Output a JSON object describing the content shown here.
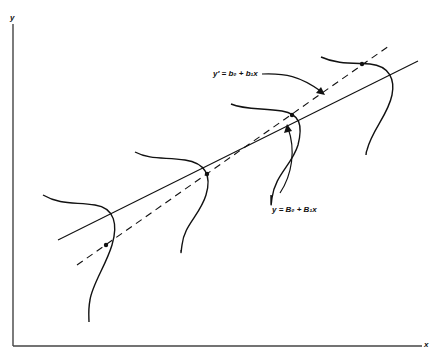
{
  "diagram": {
    "axes": {
      "x_label": "x",
      "y_label": "y"
    },
    "lines": [
      {
        "id": "true-regression",
        "style": "solid",
        "equation": "y = B₀ + B₁x",
        "from": [
          58,
          240
        ],
        "to": [
          418,
          61
        ]
      },
      {
        "id": "fitted-regression",
        "style": "dashed",
        "equation": "y′ = b₀ + b₁x",
        "from": [
          77,
          265
        ],
        "to": [
          389,
          46
        ]
      }
    ],
    "annotations": [
      {
        "text": "y′ = b₀ + b₁x",
        "points_to": "fitted-regression"
      },
      {
        "text": "y = B₀ + B₁x",
        "points_to": "true-regression"
      }
    ],
    "distribution_curves": 4,
    "colors": {
      "ink": "#111111",
      "background": "#ffffff"
    }
  }
}
